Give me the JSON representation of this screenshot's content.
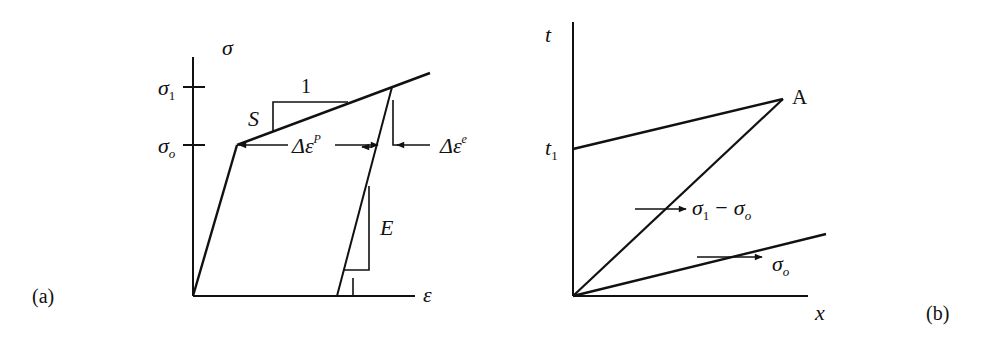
{
  "figure": {
    "panel_a": {
      "tag": "(a)",
      "y_axis_label": "σ",
      "x_axis_label": "ε",
      "sigma1_label": "σ",
      "sigma1_sub": "1",
      "sigma0_label": "σ",
      "sigma0_sub": "o",
      "slope_S_label": "S",
      "slope_S_run": "1",
      "slope_E_label": "E",
      "slope_E_run": "1",
      "delta_plastic_label": "Δε",
      "delta_plastic_sup": "P",
      "delta_elastic_label": "Δε",
      "delta_elastic_sup": "e"
    },
    "panel_b": {
      "tag": "(b)",
      "y_axis_label": "t",
      "x_axis_label": "x",
      "t1_label": "t",
      "t1_sub": "1",
      "point_label": "A",
      "wave1_label_a": "σ",
      "wave1_sub_a": "1",
      "wave1_minus": "−",
      "wave1_label_b": "σ",
      "wave1_sub_b": "o",
      "wave2_label": "σ",
      "wave2_sub": "o"
    },
    "colors": {
      "ink": "#111111",
      "background": "#ffffff"
    }
  }
}
